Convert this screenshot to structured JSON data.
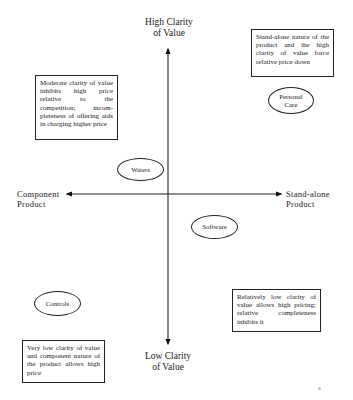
{
  "diagram": {
    "type": "quadrant",
    "axes": {
      "vertical": {
        "top_label": "High Clarity of Value",
        "top_label_lines": [
          "High Clarity",
          "of Value"
        ],
        "bottom_label": "Low Clarity of Value",
        "bottom_label_lines": [
          "Low Clarity",
          "of Value"
        ]
      },
      "horizontal": {
        "left_label": "Component Product",
        "left_label_lines": [
          "Component",
          "Product"
        ],
        "right_label": "Stand-alone Product",
        "right_label_lines": [
          "Stand-alone",
          "Product"
        ]
      }
    },
    "categories": [
      {
        "name": "Personal Care",
        "lines": [
          "Personal",
          "Care"
        ],
        "quadrant": "top-right"
      },
      {
        "name": "Waters",
        "lines": [
          "Waters"
        ],
        "quadrant": "top-left"
      },
      {
        "name": "Software",
        "lines": [
          "Software"
        ],
        "quadrant": "bottom-right"
      },
      {
        "name": "Controls",
        "lines": [
          "Controls"
        ],
        "quadrant": "bottom-left"
      }
    ],
    "notes": {
      "top_left": "Moderate clarity of value inhibits high price relative to the competition; incom-pleteness of offering aids in charging higher price",
      "top_right": "Stand-alone nature of the product and the high clarity of value force relative price down",
      "bottom_left": "Very low clarity of value and component nature of the product allows high price",
      "bottom_right": "Relatively low clarity of value allows high pricing; relative completeness inhibits it"
    }
  }
}
